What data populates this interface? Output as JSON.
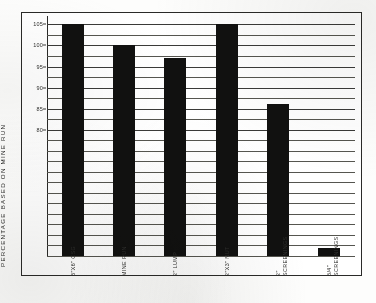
{
  "chart_data": {
    "type": "bar",
    "title": "",
    "subtitle": "",
    "xlabel": "",
    "ylabel": "PERCENTAGE BASED ON MINE RUN",
    "ylim": [
      50,
      107
    ],
    "grid": true,
    "legend": false,
    "categories": [
      "3\"X6\" CSG",
      "MINE RUN",
      "2\" LUMP",
      "2\"X3\" NUT",
      "2\" SCREENINGS",
      "3/4\" SCREENINGS"
    ],
    "category_lines": [
      [
        "3\"X6\" CSG",
        ""
      ],
      [
        "MINE RUN",
        ""
      ],
      [
        "2\" LUMP",
        ""
      ],
      [
        "2\"X3\" NUT",
        ""
      ],
      [
        "2\"",
        "SCREENINGS"
      ],
      [
        "3/4\"",
        "SCREENINGS"
      ]
    ],
    "values": [
      105,
      100,
      97,
      105,
      86,
      52
    ],
    "ytick_labels": [
      "105",
      "100",
      "95",
      "90",
      "85",
      "80"
    ],
    "ytick_values": [
      105,
      100,
      95,
      90,
      85,
      80
    ],
    "gridline_values": [
      105,
      102.5,
      100,
      97.5,
      95,
      92.5,
      90,
      87.5,
      85,
      82.5,
      80,
      77.5,
      75,
      72.5,
      70,
      67.5,
      65,
      62.5,
      60,
      57.5,
      55,
      52.5,
      50
    ],
    "bar_color": "#111110",
    "axis_color": "#2a2a28",
    "grid_color": "#3a3a38",
    "background_color": "#ffffff"
  }
}
